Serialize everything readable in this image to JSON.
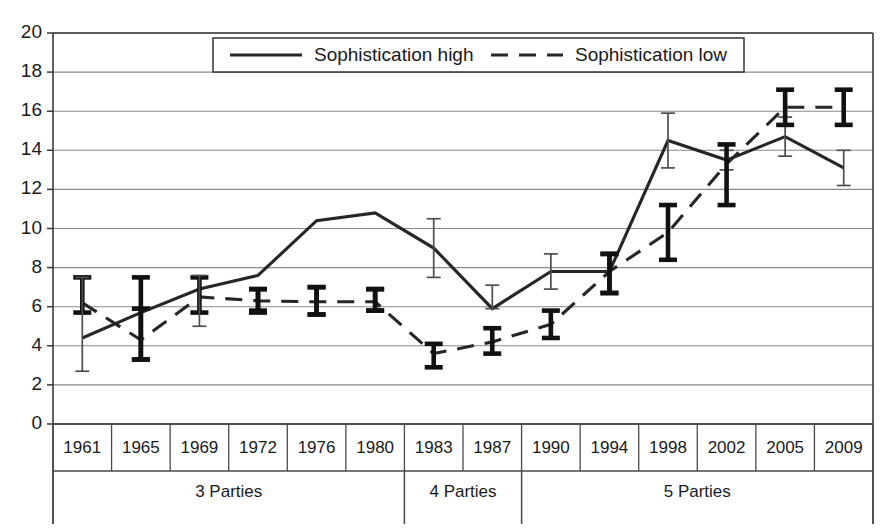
{
  "chart_data": {
    "type": "line",
    "title": "",
    "subtitle": "",
    "xlabel": "",
    "ylabel": "",
    "ylim": [
      0,
      20
    ],
    "ytick_step": 2,
    "yticks": [
      "0",
      "2",
      "4",
      "6",
      "8",
      "10",
      "12",
      "14",
      "16",
      "18",
      "20"
    ],
    "grid": true,
    "legend_position": "top-center",
    "categories": [
      "1961",
      "1965",
      "1969",
      "1972",
      "1976",
      "1980",
      "1983",
      "1987",
      "1990",
      "1994",
      "1998",
      "2002",
      "2005",
      "2009"
    ],
    "series": [
      {
        "name": "Sophistication high",
        "style": "solid",
        "values": [
          4.4,
          5.7,
          6.9,
          7.6,
          10.4,
          10.8,
          9.0,
          5.9,
          7.8,
          7.8,
          14.5,
          13.5,
          14.7,
          13.1
        ],
        "error_low": [
          5.7,
          3.3,
          5.7,
          5.7,
          5.6,
          5.8,
          7.5,
          5.9,
          6.9,
          6.7,
          13.1,
          13.0,
          13.7,
          12.2
        ],
        "error_high": [
          7.5,
          5.9,
          7.5,
          6.9,
          7.0,
          6.9,
          10.5,
          7.1,
          8.7,
          8.7,
          15.9,
          14.0,
          15.7,
          14.0
        ],
        "error_bar_weight": [
          "thick",
          "thick",
          "thick",
          "thick",
          "thick",
          "thick",
          "thin",
          "thin",
          "thin",
          "thick",
          "thin",
          "thin",
          "thin",
          "thin"
        ]
      },
      {
        "name": "Sophistication low",
        "style": "dashed",
        "values": [
          6.2,
          4.3,
          6.5,
          6.3,
          6.25,
          6.25,
          3.6,
          4.2,
          5.1,
          7.8,
          9.8,
          13.3,
          16.2,
          16.2
        ],
        "error_low": [
          2.7,
          3.3,
          5.0,
          5.8,
          5.6,
          5.8,
          2.9,
          3.6,
          4.4,
          6.7,
          8.4,
          11.2,
          15.3,
          15.3
        ],
        "error_high": [
          7.5,
          7.5,
          7.6,
          6.9,
          7.0,
          6.9,
          4.1,
          4.9,
          5.8,
          8.7,
          11.2,
          14.3,
          17.1,
          17.1
        ],
        "error_bar_weight": [
          "thin",
          "thick",
          "thin",
          "thick",
          "thick",
          "thick",
          "thick",
          "thick",
          "thick",
          "thick",
          "thick",
          "thick",
          "thick",
          "thick"
        ]
      }
    ],
    "groups": [
      {
        "label": "3 Parties",
        "from": "1961",
        "to": "1980"
      },
      {
        "label": "4 Parties",
        "from": "1983",
        "to": "1987"
      },
      {
        "label": "5 Parties",
        "from": "1990",
        "to": "2009"
      }
    ],
    "legend": [
      {
        "label": "Sophistication high",
        "style": "solid"
      },
      {
        "label": "Sophistication low",
        "style": "dashed"
      }
    ],
    "colors": {
      "series_line": "#262626",
      "grid": "#8a8a8a",
      "axis": "#3a3a3a",
      "text": "#1a1a1a",
      "background": "#ffffff"
    }
  }
}
